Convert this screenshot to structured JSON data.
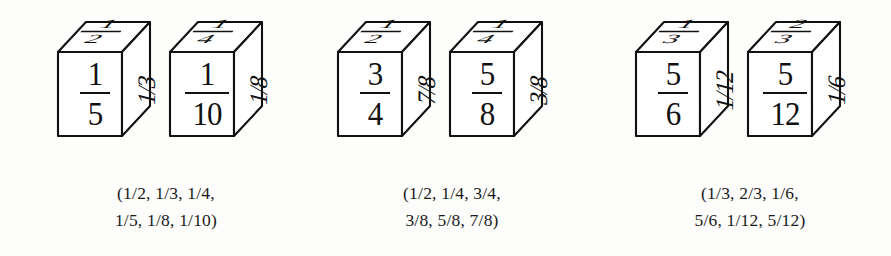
{
  "figure": {
    "type": "fraction-dice-illustration",
    "background_color": "#fdfdfc",
    "ink_color": "#111111",
    "groups": [
      {
        "id": "group-1",
        "cubes": [
          {
            "id": "cube-1",
            "front": {
              "numerator": "1",
              "denominator": "5"
            },
            "right": "1/3",
            "top": {
              "numerator": "1",
              "denominator": "2"
            }
          },
          {
            "id": "cube-2",
            "front": {
              "numerator": "1",
              "denominator": "10"
            },
            "right": "1/8",
            "top": {
              "numerator": "1",
              "denominator": "4"
            }
          }
        ],
        "caption_lines": [
          "(1/2, 1/3, 1/4,",
          "1/5, 1/8, 1/10)"
        ],
        "fractions": [
          "1/2",
          "1/3",
          "1/4",
          "1/5",
          "1/8",
          "1/10"
        ]
      },
      {
        "id": "group-2",
        "cubes": [
          {
            "id": "cube-3",
            "front": {
              "numerator": "3",
              "denominator": "4"
            },
            "right": "7/8",
            "top": {
              "numerator": "1",
              "denominator": "2"
            }
          },
          {
            "id": "cube-4",
            "front": {
              "numerator": "5",
              "denominator": "8"
            },
            "right": "3/8",
            "top": {
              "numerator": "1",
              "denominator": "4"
            }
          }
        ],
        "caption_lines": [
          "(1/2, 1/4, 3/4,",
          "3/8, 5/8, 7/8)"
        ],
        "fractions": [
          "1/2",
          "1/4",
          "3/4",
          "3/8",
          "5/8",
          "7/8"
        ]
      },
      {
        "id": "group-3",
        "cubes": [
          {
            "id": "cube-5",
            "front": {
              "numerator": "5",
              "denominator": "6"
            },
            "right": "1/12",
            "top": {
              "numerator": "1",
              "denominator": "3"
            }
          },
          {
            "id": "cube-6",
            "front": {
              "numerator": "5",
              "denominator": "12"
            },
            "right": "1/6",
            "top": {
              "numerator": "2",
              "denominator": "3"
            }
          }
        ],
        "caption_lines": [
          "(1/3, 2/3, 1/6,",
          "5/6, 1/12, 5/12)"
        ],
        "fractions": [
          "1/3",
          "2/3",
          "1/6",
          "5/6",
          "1/12",
          "5/12"
        ]
      }
    ]
  }
}
